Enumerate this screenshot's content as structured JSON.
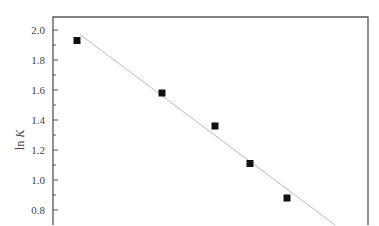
{
  "chart_data": {
    "type": "scatter",
    "title": "",
    "xlabel": "",
    "ylabel": "ln K",
    "ylabel_parts": {
      "prefix": "ln ",
      "italic": "K"
    },
    "ylim": [
      0.7,
      2.1
    ],
    "yticks": [
      0.8,
      1.0,
      1.2,
      1.4,
      1.6,
      1.8,
      2.0
    ],
    "ytick_labels": [
      "0.8",
      "1.0",
      "1.2",
      "1.4",
      "1.6",
      "1.8",
      "2.0"
    ],
    "y_minor_ticks": [
      0.9,
      1.1,
      1.3,
      1.5,
      1.7,
      1.9
    ],
    "grid": false,
    "legend": null,
    "series": [
      {
        "name": "data",
        "marker": "square",
        "color": "#111111",
        "points": [
          {
            "x_px": 77,
            "y": 1.93
          },
          {
            "x_px": 162,
            "y": 1.58
          },
          {
            "x_px": 215,
            "y": 1.36
          },
          {
            "x_px": 250,
            "y": 1.11
          },
          {
            "x_px": 287,
            "y": 0.88
          }
        ]
      },
      {
        "name": "linear fit",
        "type": "line",
        "color": "#bbbbbb",
        "start": {
          "x_px": 80,
          "y": 1.97
        },
        "end": {
          "x_px": 335,
          "y": 0.7
        }
      }
    ]
  },
  "layout": {
    "frame": {
      "left": 53,
      "top": 17,
      "right": 368,
      "bottom": 225
    },
    "y_px_at_2": 30,
    "px_per_unit": 150,
    "axis_color": "#555555"
  }
}
